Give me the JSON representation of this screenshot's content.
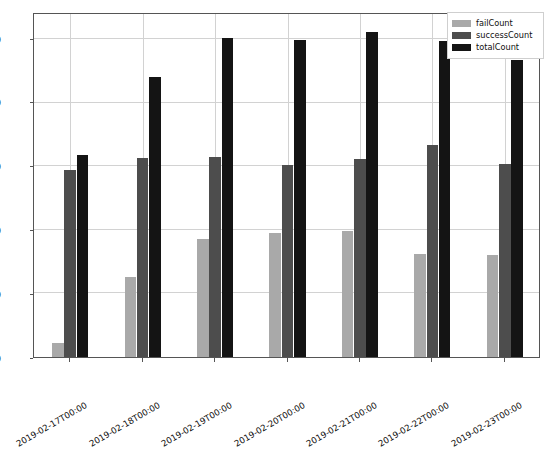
{
  "chart_data": {
    "type": "bar",
    "title": "",
    "xlabel": "",
    "ylabel": "",
    "ylim": [
      0,
      2700
    ],
    "yticks": [
      0,
      500,
      1000,
      1500,
      2000,
      2500
    ],
    "grid": true,
    "legend_position": "upper right",
    "categories": [
      "2019-02-17T00:00",
      "2019-02-18T00:00",
      "2019-02-19T00:00",
      "2019-02-20T00:00",
      "2019-02-21T00:00",
      "2019-02-22T00:00",
      "2019-02-23T00:00"
    ],
    "series": [
      {
        "name": "failCount",
        "color": "#a9a9a9",
        "values": [
          110,
          630,
          930,
          980,
          990,
          810,
          800
        ]
      },
      {
        "name": "successCount",
        "color": "#4d4d4d",
        "values": [
          1470,
          1570,
          1575,
          1510,
          1560,
          1665,
          1520
        ]
      },
      {
        "name": "totalCount",
        "color": "#141414",
        "values": [
          1590,
          2205,
          2510,
          2495,
          2560,
          2490,
          2340
        ]
      }
    ]
  }
}
